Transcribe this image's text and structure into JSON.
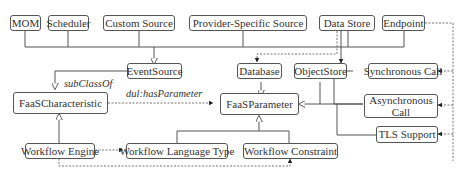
{
  "diagram": {
    "nodes": {
      "mom": "MOM",
      "scheduler": "Scheduler",
      "custom_source": "Custom Source",
      "provider_specific_source": "Provider-Specific Source",
      "data_store": "Data Store",
      "endpoint": "Endpoint",
      "event_source": "EventSource",
      "database": "Database",
      "object_store": "ObjectStore",
      "synchronous_call": "Synchronous Call",
      "asynchronous_call": "Asynchronous Call",
      "faas_characteristic": "FaaSCharacteristic",
      "faas_parameter": "FaaSParameter",
      "tls_support": "TLS Support",
      "workflow_engine": "Workflow Engine",
      "workflow_language_type": "Workflow Language Type",
      "workflow_constraint": "Workflow Constraint"
    },
    "edge_labels": {
      "subclass_of": "subClassOf",
      "has_parameter": "dul:hasParameter"
    },
    "edges": [
      {
        "from": "MOM",
        "to": "EventSource",
        "type": "subclass"
      },
      {
        "from": "Scheduler",
        "to": "EventSource",
        "type": "subclass"
      },
      {
        "from": "Custom Source",
        "to": "EventSource",
        "type": "subclass"
      },
      {
        "from": "Provider-Specific Source",
        "to": "EventSource",
        "type": "subclass"
      },
      {
        "from": "Data Store",
        "to": "EventSource",
        "type": "subclass"
      },
      {
        "from": "Endpoint",
        "to": "EventSource",
        "type": "subclass"
      },
      {
        "from": "EventSource",
        "to": "FaaSCharacteristic",
        "type": "subclass"
      },
      {
        "from": "Data Store",
        "to": "Database",
        "type": "dashed-arrow"
      },
      {
        "from": "Data Store",
        "to": "ObjectStore",
        "type": "arrow"
      },
      {
        "from": "Endpoint",
        "to": "Synchronous Call",
        "type": "dashed-arrow"
      },
      {
        "from": "Endpoint",
        "to": "Asynchronous Call",
        "type": "dashed-arrow"
      },
      {
        "from": "Endpoint",
        "to": "TLS Support",
        "type": "dashed-arrow"
      },
      {
        "from": "Database",
        "to": "FaaSParameter",
        "type": "subclass"
      },
      {
        "from": "ObjectStore",
        "to": "FaaSParameter",
        "type": "subclass"
      },
      {
        "from": "Synchronous Call",
        "to": "FaaSParameter",
        "type": "subclass"
      },
      {
        "from": "Asynchronous Call",
        "to": "FaaSParameter",
        "type": "subclass"
      },
      {
        "from": "TLS Support",
        "to": "FaaSParameter",
        "type": "subclass"
      },
      {
        "from": "FaaSCharacteristic",
        "to": "FaaSParameter",
        "type": "dashed-arrow",
        "label": "dul:hasParameter"
      },
      {
        "from": "Workflow Engine",
        "to": "FaaSCharacteristic",
        "type": "subclass"
      },
      {
        "from": "Workflow Engine",
        "to": "Workflow Language Type",
        "type": "dashed-arrow"
      },
      {
        "from": "Workflow Engine",
        "to": "Workflow Constraint",
        "type": "dashed-arrow"
      },
      {
        "from": "Workflow Language Type",
        "to": "FaaSParameter",
        "type": "subclass"
      },
      {
        "from": "Workflow Constraint",
        "to": "FaaSParameter",
        "type": "subclass"
      }
    ]
  }
}
